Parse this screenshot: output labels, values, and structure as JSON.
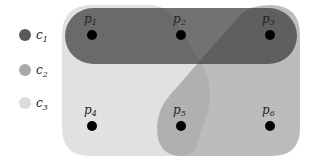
{
  "legend": [
    {
      "id": "c1",
      "label": "c",
      "sub": "1",
      "color": "#5a5a5a"
    },
    {
      "id": "c2",
      "label": "c",
      "sub": "2",
      "color": "#a9a9a9"
    },
    {
      "id": "c3",
      "label": "c",
      "sub": "3",
      "color": "#dcdcdc"
    }
  ],
  "nodes": [
    {
      "id": "p1",
      "label": "p",
      "sub": "1",
      "x": 92,
      "y": 35
    },
    {
      "id": "p2",
      "label": "p",
      "sub": "2",
      "x": 181,
      "y": 35
    },
    {
      "id": "p3",
      "label": "p",
      "sub": "3",
      "x": 270,
      "y": 35
    },
    {
      "id": "p4",
      "label": "p",
      "sub": "4",
      "x": 92,
      "y": 126
    },
    {
      "id": "p5",
      "label": "p",
      "sub": "5",
      "x": 181,
      "y": 126
    },
    {
      "id": "p6",
      "label": "p",
      "sub": "6",
      "x": 270,
      "y": 126
    }
  ],
  "hyperedges": [
    {
      "id": "c1",
      "members": [
        "p1",
        "p2",
        "p3"
      ]
    },
    {
      "id": "c2",
      "members": [
        "p3",
        "p5",
        "p6"
      ]
    },
    {
      "id": "c3",
      "members": [
        "p1",
        "p4",
        "p5"
      ]
    }
  ]
}
